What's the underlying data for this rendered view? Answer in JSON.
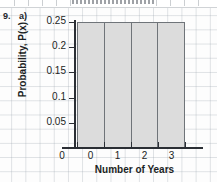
{
  "question": {
    "number": "9.",
    "part": "a)"
  },
  "chart_data": {
    "type": "bar",
    "title": "",
    "xlabel": "Number of Years",
    "ylabel": "Probability, P(x)",
    "categories": [
      "0",
      "1",
      "2",
      "3"
    ],
    "values": [
      0.25,
      0.25,
      0.25,
      0.25
    ],
    "ylim": [
      0,
      0.25
    ],
    "xlim": [
      -0.5,
      3.5
    ],
    "y_ticks": [
      {
        "value": 0.05,
        "label": "0.05"
      },
      {
        "value": 0.1,
        "label": "0.1"
      },
      {
        "value": 0.15,
        "label": "0.15"
      },
      {
        "value": 0.2,
        "label": "0.2"
      },
      {
        "value": 0.25,
        "label": "0.25"
      }
    ],
    "x_ticks": [
      {
        "value": 0,
        "label": "0"
      },
      {
        "value": 1,
        "label": "1"
      },
      {
        "value": 2,
        "label": "2"
      },
      {
        "value": 3,
        "label": "3"
      }
    ],
    "origin_label": "0",
    "grid": true,
    "legend": null,
    "bar_fill_color": "#dcdcdc",
    "bar_border_color": "#6f7479",
    "axis_color": "#2b2f35",
    "grid_color": "#96a0aa"
  }
}
